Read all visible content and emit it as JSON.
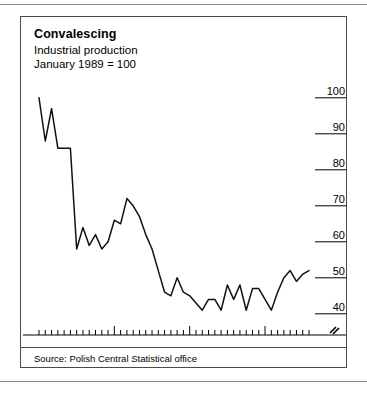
{
  "figure": {
    "title": "Convalescing",
    "subtitle_line1": "Industrial production",
    "subtitle_line2": "January 1989 = 100",
    "source": "Source: Polish Central Statistical office",
    "axis_break_symbol": "break-marker"
  },
  "chart_data": {
    "type": "line",
    "title": "Convalescing",
    "subtitle": "Industrial production, January 1989 = 100",
    "xlabel": "",
    "ylabel": "",
    "ylim": [
      38,
      103
    ],
    "yticks": [
      40,
      50,
      60,
      70,
      80,
      90,
      100
    ],
    "ytick_labels": [
      "40",
      "50",
      "60",
      "70",
      "80",
      "90",
      "100"
    ],
    "ytick_side": "right",
    "grid": false,
    "axis_break": true,
    "xlim": [
      "1989-01",
      "1992-08"
    ],
    "xtick_labels": [
      "1989",
      "1990",
      "1991",
      "1992"
    ],
    "xtick_positions": [
      6,
      18,
      30,
      42
    ],
    "minor_tick_interval_months": 1,
    "legend": "none",
    "series": [
      {
        "name": "Industrial production (Jan 1989 = 100)",
        "color": "#111111",
        "x": [
          "1989-01",
          "1989-02",
          "1989-03",
          "1989-04",
          "1989-05",
          "1989-06",
          "1989-07",
          "1989-08",
          "1989-09",
          "1989-10",
          "1989-11",
          "1989-12",
          "1990-01",
          "1990-02",
          "1990-03",
          "1990-04",
          "1990-05",
          "1990-06",
          "1990-07",
          "1990-08",
          "1990-09",
          "1990-10",
          "1990-11",
          "1990-12",
          "1991-01",
          "1991-02",
          "1991-03",
          "1991-04",
          "1991-05",
          "1991-06",
          "1991-07",
          "1991-08",
          "1991-09",
          "1991-10",
          "1991-11",
          "1991-12",
          "1992-01",
          "1992-02",
          "1992-03",
          "1992-04",
          "1992-05",
          "1992-06",
          "1992-07",
          "1992-08"
        ],
        "values": [
          100,
          88,
          97,
          86,
          86,
          86,
          58,
          64,
          59,
          62,
          58,
          60,
          66,
          65,
          72,
          70,
          67,
          62,
          58,
          52,
          46,
          45,
          50,
          46,
          45,
          43,
          41,
          44,
          44,
          41,
          48,
          44,
          48,
          41,
          47,
          47,
          44,
          41,
          46,
          50,
          52,
          49,
          51,
          52
        ]
      }
    ]
  }
}
